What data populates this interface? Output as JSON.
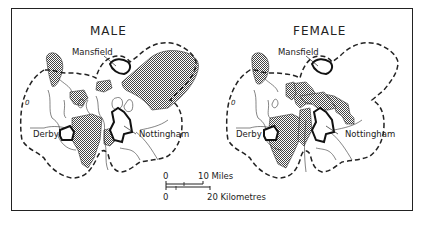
{
  "maps": [
    {
      "title": "MALE",
      "labels": {
        "mansfield": "Mansfield",
        "derby": "Derby",
        "nottingham": "Nottingham",
        "zero": "0"
      }
    },
    {
      "title": "FEMALE",
      "labels": {
        "mansfield": "Mansfield",
        "derby": "Derby",
        "nottingham": "Nottingham",
        "zero": "0"
      }
    }
  ],
  "scale": {
    "miles_zero": "0",
    "miles_label": "10 Miles",
    "km_zero": "0",
    "km_label": "20 Kilometres"
  },
  "colors": {
    "ink": "#222222",
    "hatch": "#555555",
    "background": "#ffffff"
  }
}
